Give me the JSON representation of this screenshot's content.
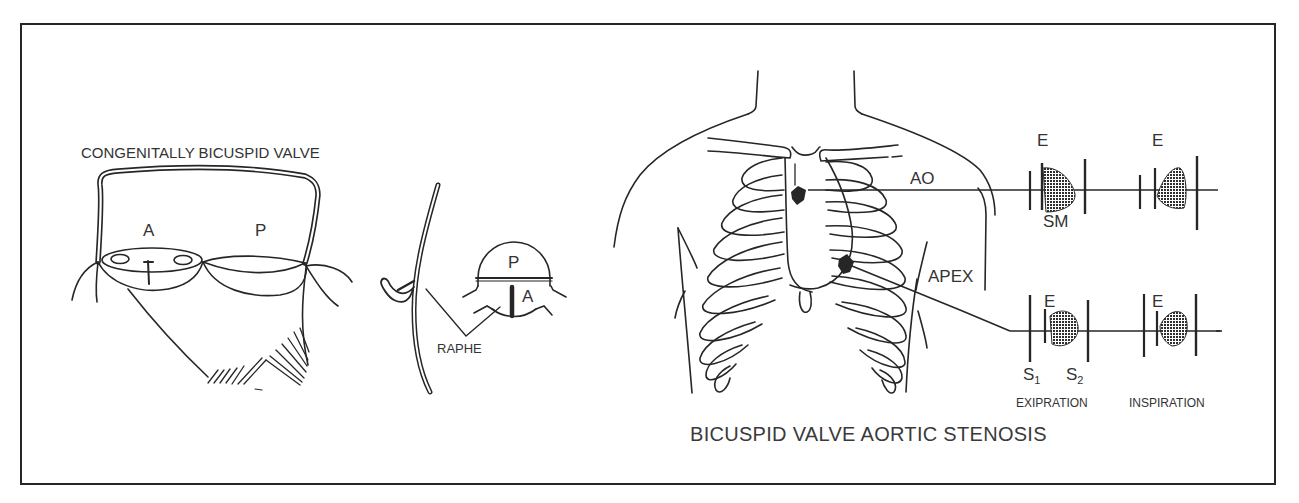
{
  "colors": {
    "ink": "#262626",
    "text": "#333333",
    "background": "#ffffff",
    "murmur": "#3a3a3a"
  },
  "left_panel": {
    "heading": "CONGENITALLY BICUSPID VALVE",
    "cusp_labels": {
      "anterior": "A",
      "posterior": "P"
    }
  },
  "middle_panel": {
    "inset_labels": {
      "posterior": "P",
      "anterior": "A"
    },
    "raphe_label": "RAPHE"
  },
  "right_panel": {
    "site_labels": {
      "aortic": "AO",
      "apex": "APEX"
    },
    "phono_aortic": {
      "expiration_marker": "E",
      "inspiration_marker": "E",
      "murmur_label": "SM"
    },
    "phono_apex": {
      "expiration_marker": "E",
      "inspiration_marker": "E",
      "s1_label": "S",
      "s1_sub": "1",
      "s2_label": "S",
      "s2_sub": "2",
      "expiration_label": "EXIPRATION",
      "inspiration_label": "INSPIRATION"
    },
    "title": "BICUSPID VALVE AORTIC STENOSIS"
  }
}
